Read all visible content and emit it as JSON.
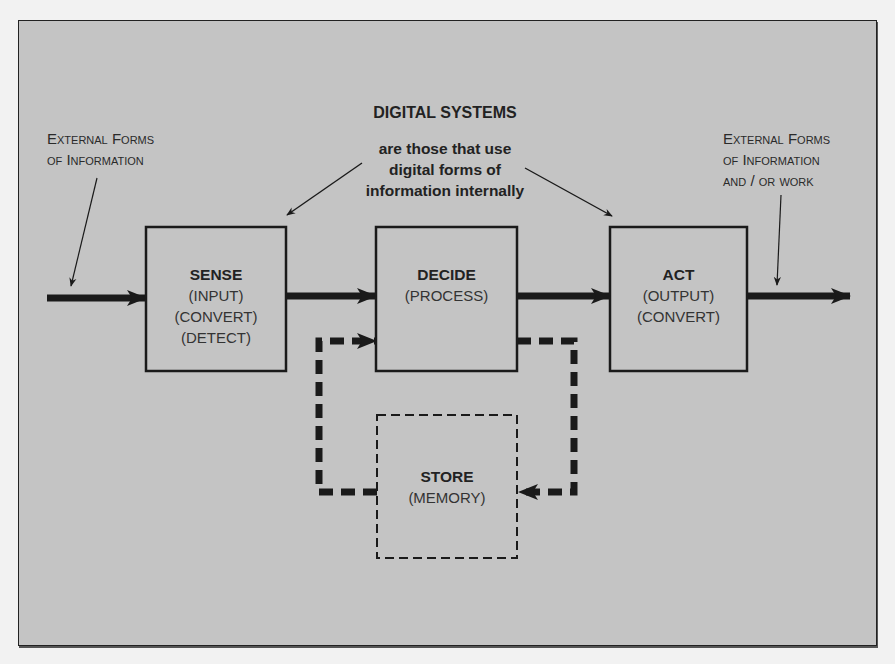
{
  "title": "DIGITAL SYSTEMS",
  "subtitle_lines": [
    "are those that use",
    "digital forms of",
    "information internally"
  ],
  "left_note_lines": [
    "External Forms",
    "of Information"
  ],
  "right_note_lines": [
    "External Forms",
    "of Information",
    "and / or work"
  ],
  "boxes": [
    {
      "id": "sense",
      "title": "SENSE",
      "lines": [
        "(INPUT)",
        "(CONVERT)",
        "(DETECT)"
      ],
      "style": "solid"
    },
    {
      "id": "decide",
      "title": "DECIDE",
      "lines": [
        "(PROCESS)"
      ],
      "style": "solid"
    },
    {
      "id": "act",
      "title": "ACT",
      "lines": [
        "(OUTPUT)",
        "(CONVERT)"
      ],
      "style": "solid"
    },
    {
      "id": "store",
      "title": "STORE",
      "lines": [
        "(MEMORY)"
      ],
      "style": "dashed"
    }
  ],
  "flows": [
    {
      "from": "external-input",
      "to": "sense",
      "style": "solid"
    },
    {
      "from": "sense",
      "to": "decide",
      "style": "solid"
    },
    {
      "from": "decide",
      "to": "act",
      "style": "solid"
    },
    {
      "from": "act",
      "to": "external-output",
      "style": "solid"
    },
    {
      "from": "decide",
      "to": "store",
      "style": "dashed"
    },
    {
      "from": "store",
      "to": "decide",
      "style": "dashed"
    }
  ],
  "colors": {
    "background": "#c4c4c4",
    "ink": "#1a1a1a"
  }
}
